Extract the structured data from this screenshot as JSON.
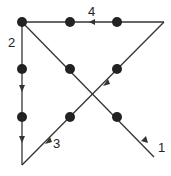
{
  "diagram": {
    "colors": {
      "line": "#333333",
      "dot": "#222222",
      "background": "#ffffff"
    },
    "dots": [
      {
        "x": 22,
        "y": 22
      },
      {
        "x": 70,
        "y": 22
      },
      {
        "x": 117,
        "y": 22
      },
      {
        "x": 22,
        "y": 69
      },
      {
        "x": 70,
        "y": 69
      },
      {
        "x": 117,
        "y": 69
      },
      {
        "x": 22,
        "y": 117
      },
      {
        "x": 70,
        "y": 117
      },
      {
        "x": 117,
        "y": 117
      }
    ],
    "path_points": [
      {
        "x": 154,
        "y": 157
      },
      {
        "x": 22,
        "y": 22
      },
      {
        "x": 22,
        "y": 165
      },
      {
        "x": 164,
        "y": 22
      },
      {
        "x": 22,
        "y": 22
      }
    ],
    "labels": [
      {
        "text": "1",
        "x": 158,
        "y": 152
      },
      {
        "text": "2",
        "x": 8,
        "y": 47
      },
      {
        "text": "3",
        "x": 53,
        "y": 148
      },
      {
        "text": "4",
        "x": 88,
        "y": 16
      }
    ]
  }
}
